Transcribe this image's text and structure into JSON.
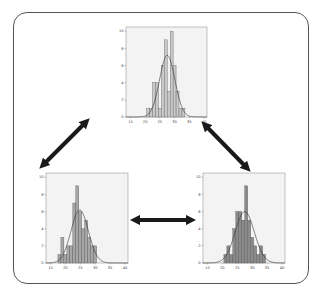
{
  "diagram": {
    "arrows": [
      {
        "id": "top-to-bottom-left",
        "from": [
          86,
          122
        ],
        "to": [
          43,
          165
        ]
      },
      {
        "id": "top-to-bottom-right",
        "from": [
          205,
          125
        ],
        "to": [
          247,
          168
        ]
      },
      {
        "id": "bottom-left-to-bottom-right",
        "from": [
          135,
          220
        ],
        "to": [
          191,
          220
        ]
      }
    ],
    "colors": {
      "frame": "#555555",
      "plot_bg": "#f3f3f3",
      "plot_border": "#999999",
      "arrow": "#1a1a1a",
      "curve": "#333333"
    }
  },
  "chart_data": [
    {
      "id": "top",
      "type": "bar",
      "box": {
        "x": 126,
        "y": 27,
        "w": 81,
        "h": 90
      },
      "bar_color": "#c8c8c8",
      "x": [
        21,
        22,
        23,
        24,
        25,
        26,
        27,
        28,
        29,
        30,
        31,
        32,
        33
      ],
      "values": [
        1,
        1,
        4,
        4,
        1,
        6,
        9,
        3,
        10,
        6,
        3,
        1,
        1
      ],
      "curve": {
        "mean": 27.5,
        "sd": 2.6,
        "peak": 7.2
      },
      "xticks": [
        "15",
        "20",
        "25",
        "30",
        "35",
        "40"
      ],
      "yticks": [
        "0",
        "2",
        "4",
        "6",
        "8",
        "10"
      ],
      "xlim": [
        13.5,
        41
      ],
      "ylim": [
        0,
        10.5
      ]
    },
    {
      "id": "bottom-left",
      "type": "bar",
      "box": {
        "x": 46,
        "y": 173,
        "w": 82,
        "h": 90
      },
      "bar_color": "#a6a6a6",
      "x": [
        18,
        19,
        20,
        21,
        22,
        23,
        24,
        25,
        26,
        27,
        28,
        29,
        30
      ],
      "values": [
        1,
        3,
        1,
        2,
        2,
        7,
        9,
        6,
        4,
        5,
        3,
        2,
        2
      ],
      "curve": {
        "mean": 24.8,
        "sd": 2.9,
        "peak": 6.2
      },
      "xticks": [
        "15",
        "20",
        "25",
        "30",
        "35",
        "40"
      ],
      "yticks": [
        "0",
        "2",
        "4",
        "6",
        "8",
        "10"
      ],
      "xlim": [
        13.5,
        41
      ],
      "ylim": [
        0,
        10.5
      ]
    },
    {
      "id": "bottom-right",
      "type": "bar",
      "box": {
        "x": 203,
        "y": 173,
        "w": 82,
        "h": 90
      },
      "bar_color": "#8a8a8a",
      "x": [
        21,
        22,
        23,
        24,
        25,
        26,
        27,
        28,
        29,
        30,
        31,
        32,
        33,
        34
      ],
      "values": [
        1,
        2,
        1,
        4,
        6,
        6,
        5,
        9,
        5,
        3,
        2,
        1,
        2,
        1
      ],
      "curve": {
        "mean": 27.5,
        "sd": 3.2,
        "peak": 6.0
      },
      "xticks": [
        "15",
        "20",
        "25",
        "30",
        "35",
        "40"
      ],
      "yticks": [
        "0",
        "2",
        "4",
        "6",
        "8",
        "10"
      ],
      "xlim": [
        13.5,
        41
      ],
      "ylim": [
        0,
        10.5
      ]
    }
  ]
}
